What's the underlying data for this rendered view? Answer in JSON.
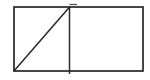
{
  "figure": {
    "name": "split-rectangle-diagram",
    "background_color": "#ffffff",
    "canvas": {
      "width": 150,
      "height": 80
    }
  },
  "style": {
    "stroke_color": "#1a1a1a",
    "divider_stroke_color": "#2b2b2b",
    "diagonal_stroke_color": "#262626",
    "tick_stroke_color": "#4a4a4a",
    "fill_color": "#ffffff",
    "outline_width": 1.6,
    "divider_width": 1.5,
    "diagonal_width": 1.5,
    "tick_width": 1.2
  },
  "shapes": {
    "outer_rectangle": {
      "label": "outer-rectangle",
      "x": 14,
      "y": 7,
      "width": 129,
      "height": 64,
      "left": 14,
      "top": 7,
      "right": 143,
      "bottom": 71
    },
    "divider": {
      "label": "vertical-divider",
      "x": 69.5,
      "y1": 7,
      "y2": 74,
      "overshoot_bottom": 3
    },
    "diagonal": {
      "label": "diagonal-line",
      "x1": 14,
      "y1": 71,
      "x2": 69.5,
      "y2": 7,
      "direction": "bottom-left-to-top-right"
    },
    "top_tick": {
      "label": "divider-top-tick",
      "x1": 69.5,
      "x2": 77,
      "y": 4.5
    },
    "left_cell": {
      "label": "left-cell",
      "x": 14,
      "y": 7,
      "width": 55.5,
      "height": 64,
      "content": "diagonal"
    },
    "right_cell": {
      "label": "right-cell",
      "x": 69.5,
      "y": 7,
      "width": 73.5,
      "height": 64,
      "content": "empty"
    }
  }
}
